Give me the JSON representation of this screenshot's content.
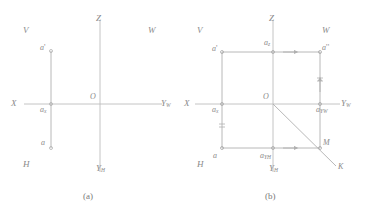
{
  "figure": {
    "caption_a": "(a)",
    "caption_b": "(b)"
  },
  "colors": {
    "line": "#b8b8b8",
    "line_dark": "#9a9a9a",
    "text": "#8a8a8a",
    "background": "#ffffff"
  },
  "panel_a": {
    "planes": {
      "v": "V",
      "w": "W",
      "h": "H"
    },
    "axes": {
      "x": "X",
      "z": "Z",
      "yw": "Y",
      "yw_sub": "W",
      "yh": "Y",
      "yh_sub": "H"
    },
    "origin": "O",
    "points": [
      {
        "name": "a-prime",
        "label": "a",
        "mark": "'",
        "sub": ""
      },
      {
        "name": "a-x",
        "label": "a",
        "mark": "",
        "sub": "x"
      },
      {
        "name": "a",
        "label": "a",
        "mark": "",
        "sub": ""
      }
    ]
  },
  "panel_b": {
    "planes": {
      "v": "V",
      "w": "W",
      "h": "H"
    },
    "axes": {
      "x": "X",
      "z": "Z",
      "yw": "Y",
      "yw_sub": "W",
      "yh": "Y",
      "yh_sub": "H"
    },
    "origin": "O",
    "points": [
      {
        "name": "a-prime",
        "label": "a",
        "mark": "'",
        "sub": ""
      },
      {
        "name": "a-z",
        "label": "a",
        "mark": "",
        "sub": "z"
      },
      {
        "name": "a-double-prime",
        "label": "a",
        "mark": "''",
        "sub": ""
      },
      {
        "name": "a-x",
        "label": "a",
        "mark": "",
        "sub": "x"
      },
      {
        "name": "a-yw",
        "label": "a",
        "mark": "",
        "sub": "Y"
      },
      {
        "name": "a-yw-sub2",
        "label": "W",
        "mark": "",
        "sub": ""
      },
      {
        "name": "a",
        "label": "a",
        "mark": "",
        "sub": ""
      },
      {
        "name": "a-yh",
        "label": "a",
        "mark": "",
        "sub": "Y"
      },
      {
        "name": "a-yh-sub2",
        "label": "H",
        "mark": "",
        "sub": ""
      },
      {
        "name": "m",
        "label": "M",
        "mark": "",
        "sub": ""
      },
      {
        "name": "k",
        "label": "K",
        "mark": "",
        "sub": ""
      }
    ]
  }
}
